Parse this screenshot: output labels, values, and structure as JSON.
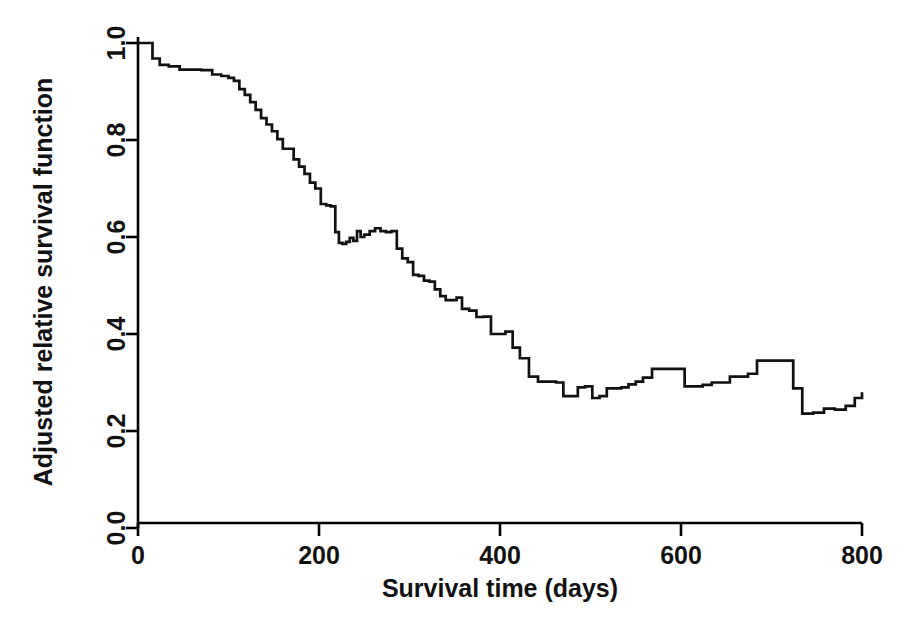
{
  "chart_data": {
    "type": "line",
    "subtype": "step",
    "title": "",
    "xlabel": "Survival time (days)",
    "ylabel": "Adjusted relative survival function",
    "xlim": [
      0,
      800
    ],
    "ylim": [
      0.0,
      1.0
    ],
    "xticks": [
      0,
      200,
      400,
      600,
      800
    ],
    "xtick_labels": [
      "0",
      "200",
      "400",
      "600",
      "800"
    ],
    "yticks": [
      0.0,
      0.2,
      0.4,
      0.6,
      0.8,
      1.0
    ],
    "ytick_labels": [
      "0.0",
      "0.2",
      "0.4",
      "0.6",
      "0.8",
      "1.0"
    ],
    "grid": false,
    "legend": null,
    "line_color": "#111111",
    "background_color": "#ffffff",
    "series": [
      {
        "name": "Adjusted relative survival",
        "step_type": "post",
        "x": [
          0,
          8,
          16,
          24,
          34,
          46,
          58,
          70,
          82,
          92,
          100,
          106,
          112,
          118,
          124,
          130,
          136,
          142,
          148,
          154,
          160,
          166,
          172,
          178,
          184,
          190,
          196,
          202,
          208,
          213,
          218,
          222,
          226,
          230,
          234,
          238,
          242,
          246,
          250,
          256,
          262,
          268,
          274,
          280,
          286,
          292,
          298,
          304,
          310,
          316,
          322,
          328,
          334,
          340,
          346,
          352,
          358,
          366,
          374,
          382,
          390,
          398,
          406,
          414,
          422,
          432,
          442,
          452,
          462,
          470,
          478,
          486,
          494,
          502,
          510,
          518,
          526,
          534,
          542,
          550,
          558,
          568,
          580,
          592,
          604,
          614,
          624,
          634,
          644,
          654,
          664,
          674,
          684,
          694,
          704,
          714,
          724,
          734,
          746,
          758,
          770,
          782,
          792,
          800
        ],
        "y": [
          1.0,
          1.0,
          0.968,
          0.955,
          0.952,
          0.945,
          0.945,
          0.944,
          0.935,
          0.932,
          0.928,
          0.922,
          0.905,
          0.893,
          0.878,
          0.862,
          0.845,
          0.832,
          0.818,
          0.802,
          0.782,
          0.782,
          0.76,
          0.745,
          0.73,
          0.712,
          0.7,
          0.668,
          0.665,
          0.663,
          0.61,
          0.588,
          0.586,
          0.59,
          0.598,
          0.592,
          0.612,
          0.6,
          0.605,
          0.612,
          0.618,
          0.612,
          0.61,
          0.612,
          0.576,
          0.556,
          0.548,
          0.522,
          0.52,
          0.51,
          0.508,
          0.492,
          0.478,
          0.47,
          0.47,
          0.475,
          0.452,
          0.448,
          0.435,
          0.436,
          0.4,
          0.4,
          0.405,
          0.372,
          0.35,
          0.312,
          0.302,
          0.302,
          0.3,
          0.272,
          0.272,
          0.29,
          0.292,
          0.268,
          0.272,
          0.288,
          0.288,
          0.29,
          0.296,
          0.302,
          0.31,
          0.328,
          0.328,
          0.328,
          0.292,
          0.292,
          0.295,
          0.3,
          0.3,
          0.312,
          0.312,
          0.318,
          0.345,
          0.345,
          0.345,
          0.345,
          0.288,
          0.236,
          0.238,
          0.246,
          0.244,
          0.252,
          0.268,
          0.28
        ]
      }
    ]
  },
  "axis": {
    "x_title": "Survival time (days)",
    "y_title": "Adjusted relative survival function",
    "x_tick_labels": [
      "0",
      "200",
      "400",
      "600",
      "800"
    ],
    "y_tick_labels": [
      "0.0",
      "0.2",
      "0.4",
      "0.6",
      "0.8",
      "1.0"
    ]
  }
}
